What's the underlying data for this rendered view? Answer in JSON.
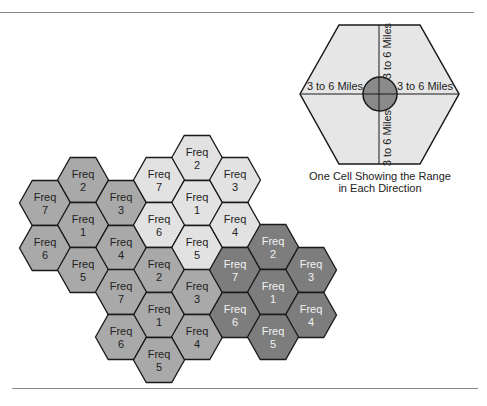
{
  "colors": {
    "light": "#e2e2e2",
    "medium": "#a9a9a9",
    "dark": "#7d7d7d",
    "big_cell": "#e6e6e6",
    "tower": "#8a8a8a",
    "stroke": "#1a1a1a"
  },
  "cell_word": "Freq",
  "clusters": [
    {
      "name": "left-cluster",
      "shade": "medium",
      "text_color": "#222222",
      "cells": [
        {
          "freq": "2",
          "cx": 83,
          "cy": 180
        },
        {
          "freq": "7",
          "cx": 45,
          "cy": 203
        },
        {
          "freq": "3",
          "cx": 121,
          "cy": 203
        },
        {
          "freq": "1",
          "cx": 83,
          "cy": 225
        },
        {
          "freq": "6",
          "cx": 45,
          "cy": 248
        },
        {
          "freq": "4",
          "cx": 121,
          "cy": 248
        },
        {
          "freq": "5",
          "cx": 83,
          "cy": 270
        }
      ]
    },
    {
      "name": "top-cluster",
      "shade": "light",
      "text_color": "#222222",
      "cells": [
        {
          "freq": "2",
          "cx": 197,
          "cy": 158
        },
        {
          "freq": "7",
          "cx": 159,
          "cy": 180
        },
        {
          "freq": "3",
          "cx": 235,
          "cy": 180
        },
        {
          "freq": "1",
          "cx": 197,
          "cy": 203
        },
        {
          "freq": "6",
          "cx": 159,
          "cy": 225
        },
        {
          "freq": "4",
          "cx": 235,
          "cy": 225
        },
        {
          "freq": "5",
          "cx": 197,
          "cy": 248
        }
      ]
    },
    {
      "name": "bottom-cluster",
      "shade": "medium",
      "text_color": "#222222",
      "cells": [
        {
          "freq": "2",
          "cx": 159,
          "cy": 270
        },
        {
          "freq": "7",
          "cx": 121,
          "cy": 292
        },
        {
          "freq": "3",
          "cx": 197,
          "cy": 292
        },
        {
          "freq": "1",
          "cx": 159,
          "cy": 315
        },
        {
          "freq": "6",
          "cx": 121,
          "cy": 337
        },
        {
          "freq": "4",
          "cx": 197,
          "cy": 337
        },
        {
          "freq": "5",
          "cx": 159,
          "cy": 360
        }
      ]
    },
    {
      "name": "right-cluster",
      "shade": "dark",
      "text_color": "#f2f2f2",
      "cells": [
        {
          "freq": "2",
          "cx": 273,
          "cy": 247
        },
        {
          "freq": "7",
          "cx": 235,
          "cy": 270
        },
        {
          "freq": "3",
          "cx": 311,
          "cy": 270
        },
        {
          "freq": "1",
          "cx": 273,
          "cy": 292
        },
        {
          "freq": "6",
          "cx": 235,
          "cy": 315
        },
        {
          "freq": "4",
          "cx": 311,
          "cy": 315
        },
        {
          "freq": "5",
          "cx": 273,
          "cy": 337
        }
      ]
    }
  ],
  "single_cell": {
    "range_label": "3 to 6 Miles",
    "caption_line1": "One Cell Showing the Range",
    "caption_line2": "in Each Direction"
  }
}
